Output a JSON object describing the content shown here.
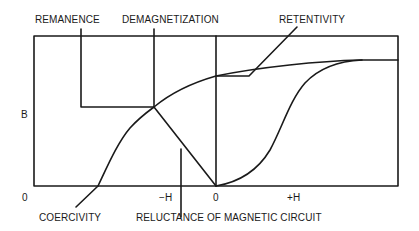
{
  "diagram": {
    "type": "magnetization-curve",
    "labels": {
      "remanence": "REMANENCE",
      "demagnetization": "DEMAGNETIZATION",
      "retentivity": "RETENTIVITY",
      "coercivity": "COERCIVITY",
      "reluctance": "RELUCTANCE OF MAGNETIC CIRCUIT"
    },
    "axes": {
      "y_label": "B",
      "origin_left": "0",
      "neg_h": "−H",
      "origin_center": "0",
      "pos_h": "+H"
    },
    "colors": {
      "line": "#1a1a1a",
      "background": "#ffffff"
    }
  }
}
